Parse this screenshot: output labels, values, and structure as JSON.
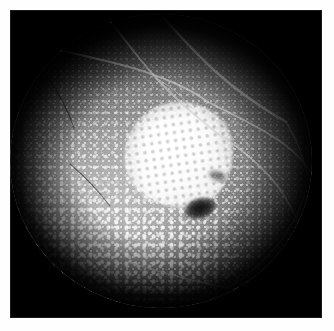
{
  "figure": {
    "kind": "fundus-fluorescein-angiogram",
    "modality": "Fluorescein angiography",
    "caption": "",
    "eye_field": "posterior pole",
    "background_color": "#ffffff",
    "plate_color": "#000000"
  },
  "geometry": {
    "image_width": 334,
    "image_height": 331,
    "plate_left": 10,
    "plate_top": 10,
    "plate_width": 312,
    "plate_height": 308,
    "disc_center_x": 166,
    "disc_center_y": 160,
    "disc_radius": 150
  },
  "features": {
    "macular_lesion": {
      "label": "confluent hyperfluorescent macular lesion",
      "center_x_pct": 56,
      "center_y_pct": 48,
      "width_pct": 36,
      "height_pct": 36,
      "brightness": "high"
    },
    "foveal_spot": {
      "label": "central hypofluorescent spot",
      "center_x_pct": 63,
      "center_y_pct": 66,
      "brightness": "very low"
    },
    "punctate_dots": {
      "label": "diffuse punctate hyperfluorescence",
      "density": "dense",
      "distribution": "inferior and nasal predominant"
    },
    "vessels": {
      "label": "retinal vessel arcades",
      "count": 9,
      "stroke_color": "#cdcdcd"
    }
  },
  "vessel_paths": [
    "M 2 26 C 40 34, 78 42, 116 52 C 148 61, 176 72, 198 88",
    "M 96 2 C 112 22, 128 44, 146 64 C 166 86, 188 104, 208 120",
    "M 150 0 C 168 20, 186 40, 206 58 C 228 78, 252 94, 276 108",
    "M 198 88 C 218 98, 240 108, 262 122 C 280 133, 294 146, 302 160",
    "M 208 120 C 230 134, 250 150, 266 170 C 280 188, 289 208, 294 226",
    "M 276 108 C 286 124, 293 142, 297 160",
    "M 146 64 C 160 72, 172 82, 182 94",
    "M 118 248 C 150 258, 186 268, 218 274 C 246 279, 270 280, 288 276",
    "M 218 274 C 238 262, 256 246, 270 228 C 282 212, 290 196, 294 182"
  ],
  "vessel_widths": [
    2.2,
    1.9,
    2.4,
    1.7,
    1.6,
    1.2,
    1.0,
    1.8,
    1.5
  ],
  "dark_vessel_paths": [
    "M 36 60 C 48 78, 58 96, 64 114",
    "M 60 150 C 74 162, 88 176, 100 192"
  ],
  "dark_vessel_widths": [
    1.3,
    1.1
  ]
}
